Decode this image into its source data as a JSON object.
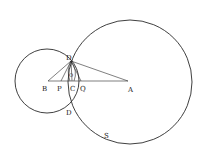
{
  "figure": {
    "labels": {
      "D_top": "D",
      "D_bottom": "D",
      "B": "B",
      "P": "P",
      "C": "C",
      "Q": "Q",
      "A": "A",
      "O": "O",
      "S": "S"
    }
  }
}
